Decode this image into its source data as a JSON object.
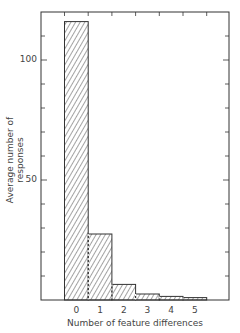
{
  "chart_data": {
    "type": "bar",
    "title": "",
    "xlabel": "Number of feature differences",
    "ylabel": "Average number of responses",
    "categories": [
      "0",
      "1",
      "2",
      "3",
      "4",
      "5"
    ],
    "values": [
      116,
      27.5,
      6.5,
      2.5,
      1.5,
      1
    ],
    "ylim": [
      0,
      120
    ],
    "yticks_labeled": [
      "50",
      "100"
    ],
    "ytick_step": 10,
    "grid": false,
    "legend": null,
    "bar_style": "diagonal hatch, dashed separators between adjacent bars"
  },
  "axis": {
    "y100": "100",
    "y50": "50"
  }
}
